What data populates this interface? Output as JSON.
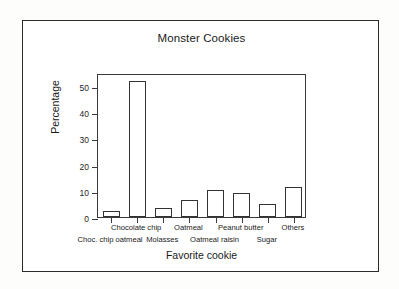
{
  "figure": {
    "frame_color": "#2b2b2b",
    "background": "#ffffff"
  },
  "chart_data": {
    "type": "bar",
    "title": "Monster Cookies",
    "xlabel": "Favorite cookie",
    "ylabel": "Percentage",
    "categories": [
      "Choc. chip oatmeal",
      "Chocolate chip",
      "Molasses",
      "Oatmeal",
      "Oatmeal raisin",
      "Peanut butter",
      "Sugar",
      "Others"
    ],
    "values": [
      2.3,
      52,
      3.5,
      6.5,
      10.2,
      9.2,
      4.8,
      11.5
    ],
    "ylim": [
      0,
      55
    ],
    "yticks": [
      0,
      10,
      20,
      30,
      40,
      50
    ],
    "ytick_labels": [
      "0",
      "10",
      "20",
      "30",
      "40",
      "50"
    ],
    "grid": false,
    "legend": false,
    "bar_fill": "#ffffff",
    "bar_edge": "#333333",
    "label_rows": [
      "bottom",
      "top",
      "bottom",
      "top",
      "bottom",
      "top",
      "bottom",
      "top"
    ]
  }
}
